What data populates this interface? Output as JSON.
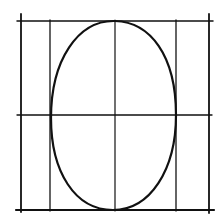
{
  "diagram": {
    "stroke_color": "#111111",
    "background": "#ffffff",
    "vertical_lines_x": [
      21,
      50,
      115,
      176,
      209
    ],
    "horizontal_lines_y": [
      21,
      115,
      210
    ],
    "ellipse": {
      "cx": 113,
      "cy": 116,
      "rx": 63,
      "ry": 94
    }
  }
}
